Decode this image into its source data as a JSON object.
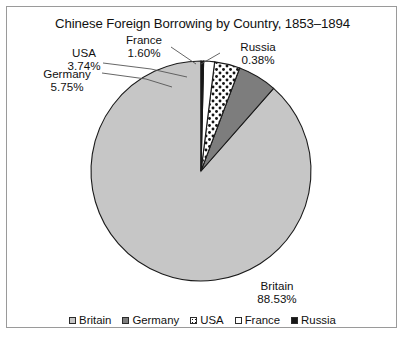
{
  "chart_data": {
    "type": "pie",
    "title": "Chinese Foreign Borrowing by Country, 1853–1894",
    "categories": [
      "Britain",
      "Germany",
      "USA",
      "France",
      "Russia"
    ],
    "values": [
      88.53,
      5.75,
      3.74,
      1.6,
      0.38
    ],
    "value_labels": [
      "88.53%",
      "5.75%",
      "3.74%",
      "1.60%",
      "0.38%"
    ],
    "unit": "%",
    "xlabel": "",
    "ylabel": "",
    "grid": false,
    "legend_position": "bottom",
    "start_angle_deg": 0,
    "direction": "counterclockwise",
    "slice_styles": [
      {
        "name": "Britain",
        "fill": "#c6c6c6",
        "pattern": "solid",
        "stroke": "#1a1a1a"
      },
      {
        "name": "Germany",
        "fill": "#7d7d7d",
        "pattern": "solid",
        "stroke": "#1a1a1a"
      },
      {
        "name": "USA",
        "fill": "#ffffff",
        "pattern": "dots",
        "stroke": "#1a1a1a"
      },
      {
        "name": "France",
        "fill": "#ffffff",
        "pattern": "solid",
        "stroke": "#1a1a1a"
      },
      {
        "name": "Russia",
        "fill": "#161616",
        "pattern": "solid",
        "stroke": "#1a1a1a"
      }
    ]
  },
  "labels": {
    "britain": {
      "name": "Britain",
      "value": "88.53%"
    },
    "germany": {
      "name": "Germany",
      "value": "5.75%"
    },
    "usa": {
      "name": "USA",
      "value": "3.74%"
    },
    "france": {
      "name": "France",
      "value": "1.60%"
    },
    "russia": {
      "name": "Russia",
      "value": "0.38%"
    }
  },
  "legend": {
    "items": [
      {
        "label": "Britain"
      },
      {
        "label": "Germany"
      },
      {
        "label": "USA"
      },
      {
        "label": "France"
      },
      {
        "label": "Russia"
      }
    ]
  },
  "colors": {
    "britain": "#c6c6c6",
    "germany": "#7d7d7d",
    "usa": "#ffffff",
    "france": "#ffffff",
    "russia": "#161616",
    "outline": "#1a1a1a",
    "frame": "#9a9a9a"
  }
}
